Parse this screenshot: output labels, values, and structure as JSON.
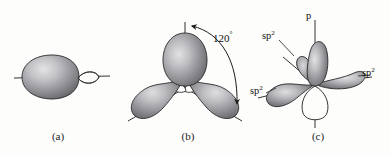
{
  "figure": {
    "background_color": "#fdfdfc",
    "line_color": "#1c1c1c",
    "lobe_fill_dark": "#6e6e72",
    "lobe_fill_light": "#cfcfd2",
    "lobe_stroke": "#2a2a2c"
  },
  "panels": {
    "a": {
      "caption": "(a)",
      "description": "single sp2 hybrid orbital",
      "labels": []
    },
    "b": {
      "caption": "(b)",
      "description": "three sp2 hybrid orbitals",
      "angle_label": "120",
      "angle_unit": "°"
    },
    "c": {
      "caption": "(c)",
      "description": "three sp2 hybrid orbitals plus unhybridized p orbital",
      "label_p": "p",
      "label_sp2_upper_left": "sp",
      "label_sp2_upper_left_sup": "2",
      "label_sp2_lower_left": "sp",
      "label_sp2_lower_left_sup": "2",
      "label_sp2_right": "sp",
      "label_sp2_right_sup": "2"
    }
  }
}
